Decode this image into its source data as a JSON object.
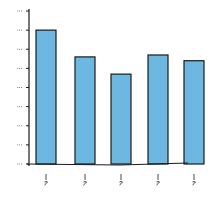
{
  "chart_data": {
    "type": "bar",
    "title": "",
    "xlabel": "",
    "ylabel": "",
    "categories": [
      "",
      "",
      "",
      "",
      ""
    ],
    "values": [
      70,
      56,
      47,
      57,
      54
    ],
    "ylim": [
      0,
      80
    ],
    "yticks": [
      0,
      10,
      20,
      30,
      40,
      50,
      60,
      70,
      80
    ],
    "grid": false,
    "legend": null,
    "bar_color": "#6cb8e0",
    "edge_color": "#1a1a1a",
    "note": "Hand-drawn chart; axis tick labels and category labels are illegible scribbles"
  }
}
